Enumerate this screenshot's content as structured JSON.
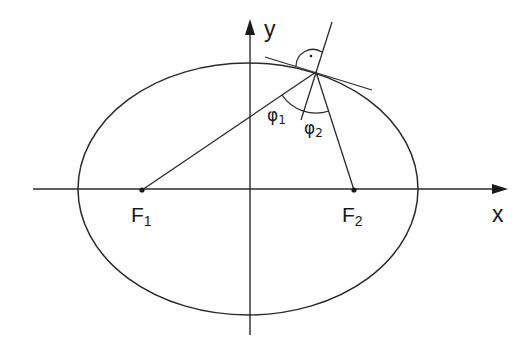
{
  "diagram": {
    "axes": {
      "x_label": "x",
      "y_label": "y"
    },
    "foci": [
      {
        "label": "F",
        "subscript": "1",
        "x": 142,
        "y": 190
      },
      {
        "label": "F",
        "subscript": "2",
        "x": 354,
        "y": 190
      }
    ],
    "point_on_ellipse": {
      "x": 316,
      "y": 72
    },
    "angles": [
      {
        "label": "φ",
        "subscript": "1"
      },
      {
        "label": "φ",
        "subscript": "2"
      }
    ],
    "right_angle_marker": "·",
    "colors": {
      "stroke": "#2a2a2a",
      "background": "#ffffff"
    }
  }
}
